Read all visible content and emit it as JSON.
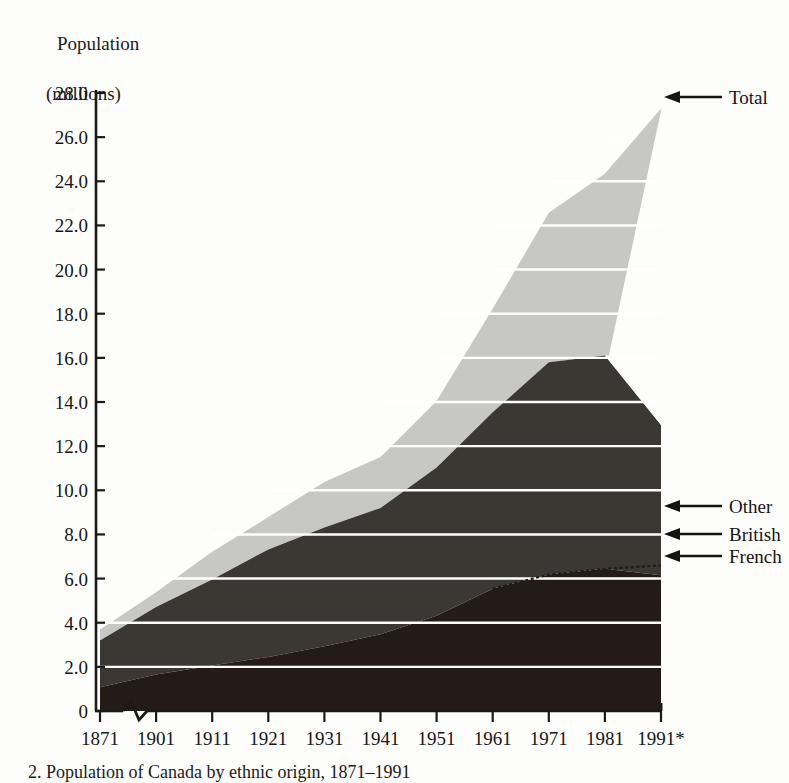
{
  "figure": {
    "axis_title_line1": "Population",
    "axis_title_line2": "(millions)",
    "caption": "2. Population of Canada by ethnic origin, 1871–1991"
  },
  "annotations": [
    {
      "name": "total",
      "label": "Total",
      "arrow": "left-arrow-icon"
    },
    {
      "name": "other",
      "label": "Other",
      "arrow": "left-arrow-icon"
    },
    {
      "name": "british",
      "label": "British",
      "arrow": "left-arrow-icon"
    },
    {
      "name": "french",
      "label": "French",
      "arrow": "left-arrow-icon"
    }
  ],
  "colors": {
    "background": "#fdfdfb",
    "other_band": "#c7c7c4",
    "british_band": "#3b3733",
    "french_band": "#241b17",
    "gridline": "#ffffff",
    "axis": "#1a1a1a"
  },
  "chart_data": {
    "type": "area",
    "title": "Population (millions)",
    "xlabel": "",
    "ylabel": "Population (millions)",
    "stacked": true,
    "grid": true,
    "legend_position": "right-annotations",
    "axis_break": {
      "between": [
        "1871",
        "1901"
      ],
      "style": "zigzag"
    },
    "ylim": [
      0,
      28
    ],
    "ytick_labels": [
      "0",
      "2.0",
      "4.0",
      "6.0",
      "8.0",
      "10.0",
      "12.0",
      "14.0",
      "16.0",
      "18.0",
      "20.0",
      "22.0",
      "24.0",
      "26.0",
      "28.0"
    ],
    "ytick_values": [
      0,
      2,
      4,
      6,
      8,
      10,
      12,
      14,
      16,
      18,
      20,
      22,
      24,
      26,
      28
    ],
    "categories": [
      "1871",
      "1901",
      "1911",
      "1921",
      "1931",
      "1941",
      "1951",
      "1961",
      "1971",
      "1981",
      "1991*"
    ],
    "series": [
      {
        "name": "French",
        "values": [
          1.08,
          1.65,
          2.06,
          2.45,
          2.93,
          3.48,
          4.32,
          5.54,
          6.18,
          6.44,
          6.15
        ]
      },
      {
        "name": "British",
        "values": [
          2.11,
          3.06,
          3.9,
          4.87,
          5.38,
          5.72,
          6.71,
          7.99,
          9.62,
          9.67,
          6.81
        ]
      },
      {
        "name": "Other",
        "values": [
          0.5,
          0.67,
          1.25,
          1.47,
          2.06,
          2.31,
          3.02,
          4.7,
          6.77,
          8.23,
          14.34
        ]
      }
    ],
    "totals": [
      3.69,
      5.38,
      7.21,
      8.79,
      10.37,
      11.51,
      14.05,
      18.23,
      22.57,
      24.34,
      27.3
    ]
  }
}
